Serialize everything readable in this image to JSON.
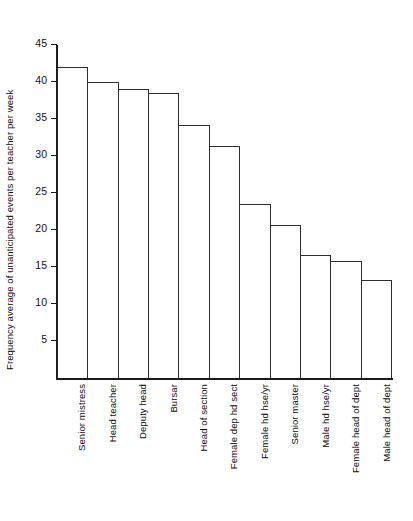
{
  "chart_data": {
    "type": "bar",
    "title": "",
    "xlabel": "",
    "ylabel": "Frequency average of unanticipated events per teacher per week",
    "ylim": [
      0,
      45
    ],
    "yticks": [
      5,
      10,
      15,
      20,
      25,
      30,
      35,
      40,
      45
    ],
    "grid": false,
    "legend": null,
    "categories": [
      "Senior mistress",
      "Head teacher",
      "Deputy head",
      "Bursar",
      "Head of section",
      "Female dep hd sect",
      "Female hd hse/yr",
      "Senior master",
      "Male hd hse/yr",
      "Female head of dept",
      "Male head of dept"
    ],
    "values": [
      42.0,
      40.0,
      39.0,
      38.5,
      34.2,
      31.3,
      23.5,
      20.7,
      16.6,
      15.8,
      13.2
    ],
    "bar_style": {
      "fill": "#ffffff",
      "edge": "#2d2d2d"
    },
    "axis_color": "#1b1b1b",
    "text_color": "#111111"
  }
}
